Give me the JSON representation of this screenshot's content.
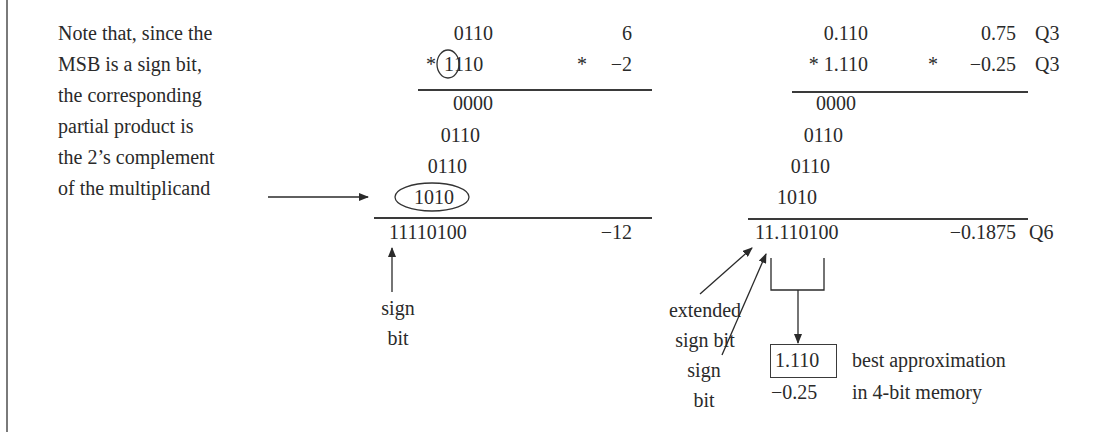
{
  "note": {
    "lines": [
      "Note that, since the",
      "MSB is a sign bit,",
      "the corresponding",
      "partial product is",
      "the 2’s complement",
      "of the multiplicand"
    ]
  },
  "integer_example": {
    "multiplicand": "0110",
    "multiplier_star": "*",
    "multiplier_msb": "1",
    "multiplier_rest": "110",
    "decimal_multiplicand": "6",
    "decimal_star": "*",
    "decimal_multiplier": "−2",
    "partial_products": [
      "0000",
      "0110",
      "0110",
      "1010"
    ],
    "result": "11110100",
    "decimal_result": "−12",
    "sign_bit_label_1": "sign",
    "sign_bit_label_2": "bit"
  },
  "fractional_example": {
    "multiplicand": "0.110",
    "multiplier": "* 1.110",
    "decimal_multiplicand": "0.75",
    "decimal_star": "*",
    "decimal_multiplier": "−0.25",
    "format_multiplicand": "Q3",
    "format_multiplier": "Q3",
    "partial_products": [
      "0000",
      "0110",
      "0110",
      "1010"
    ],
    "result": "11.110100",
    "decimal_result": "−0.1875",
    "format_result": "Q6",
    "extended_sign_label_1": "extended",
    "extended_sign_label_2": "sign bit",
    "sign_bit_label_1": "sign",
    "sign_bit_label_2": "bit",
    "approximation_value": "1.110",
    "approximation_decimal": "−0.25",
    "approximation_label_1": "best approximation",
    "approximation_label_2": "in 4-bit memory"
  },
  "colors": {
    "ink": "#2a2a2a",
    "border": "#7a7a7a",
    "background": "#ffffff"
  }
}
